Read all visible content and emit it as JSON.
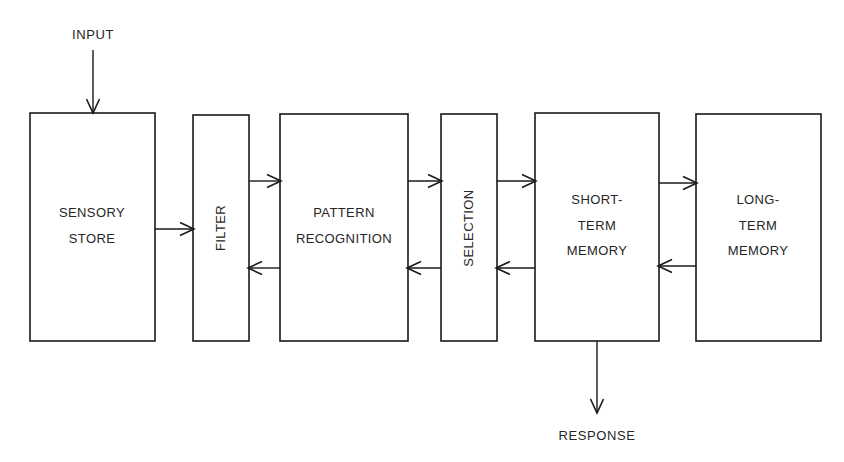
{
  "diagram": {
    "background_color": "#ffffff",
    "line_color": "#1a1a1a",
    "text_color": "#262626",
    "io_labels": {
      "input": "INPUT",
      "response": "RESPONSE"
    },
    "boxes": [
      {
        "id": "sensory-store",
        "label_lines": [
          "SENSORY",
          "STORE"
        ],
        "orientation": "horizontal"
      },
      {
        "id": "filter",
        "label_lines": [
          "FILTER"
        ],
        "orientation": "vertical"
      },
      {
        "id": "pattern-recognition",
        "label_lines": [
          "PATTERN",
          "RECOGNITION"
        ],
        "orientation": "horizontal"
      },
      {
        "id": "selection",
        "label_lines": [
          "SELECTION"
        ],
        "orientation": "vertical"
      },
      {
        "id": "short-term-memory",
        "label_lines": [
          "SHORT-",
          "TERM",
          "MEMORY"
        ],
        "orientation": "horizontal"
      },
      {
        "id": "long-term-memory",
        "label_lines": [
          "LONG-",
          "TERM",
          "MEMORY"
        ],
        "orientation": "horizontal"
      }
    ],
    "connections": [
      {
        "from": "input",
        "to": "sensory-store",
        "direction": "down"
      },
      {
        "from": "sensory-store",
        "to": "filter",
        "direction": "right"
      },
      {
        "from": "filter",
        "to": "pattern-recognition",
        "direction": "right"
      },
      {
        "from": "pattern-recognition",
        "to": "filter",
        "direction": "left"
      },
      {
        "from": "pattern-recognition",
        "to": "selection",
        "direction": "right"
      },
      {
        "from": "selection",
        "to": "pattern-recognition",
        "direction": "left"
      },
      {
        "from": "selection",
        "to": "short-term-memory",
        "direction": "right"
      },
      {
        "from": "short-term-memory",
        "to": "selection",
        "direction": "left"
      },
      {
        "from": "short-term-memory",
        "to": "long-term-memory",
        "direction": "right"
      },
      {
        "from": "long-term-memory",
        "to": "short-term-memory",
        "direction": "left"
      },
      {
        "from": "short-term-memory",
        "to": "response",
        "direction": "down"
      }
    ]
  }
}
